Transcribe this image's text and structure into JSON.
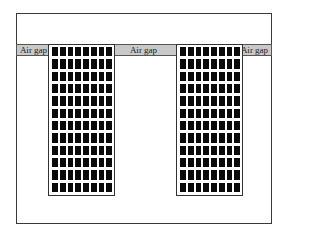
{
  "diagram": {
    "outer_box": {
      "label": ""
    },
    "air_gaps": [
      {
        "position": "left",
        "label": "Air gap"
      },
      {
        "position": "center",
        "label": "Air gap"
      },
      {
        "position": "right",
        "label": "Air gap"
      }
    ],
    "coils": [
      {
        "position": "left",
        "columns": 8,
        "rows": 12
      },
      {
        "position": "right",
        "columns": 8,
        "rows": 12
      }
    ],
    "colors": {
      "air_gap_fill": "#c9c9c9",
      "conductor_fill": "#0a0a0a",
      "outline": "#3a3a3a",
      "background": "#ffffff"
    }
  }
}
